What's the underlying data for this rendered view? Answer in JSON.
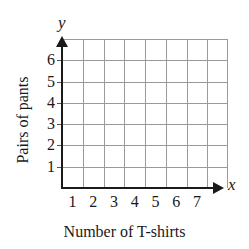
{
  "chart_data": {
    "type": "scatter",
    "title": "",
    "xlabel": "Number of T-shirts",
    "ylabel": "Pairs of pants",
    "x_axis_variable": "x",
    "y_axis_variable": "y",
    "xticks": [
      1,
      2,
      3,
      4,
      5,
      6,
      7
    ],
    "yticks": [
      1,
      2,
      3,
      4,
      5,
      6
    ],
    "xtick_labels": [
      "1",
      "2",
      "3",
      "4",
      "5",
      "6",
      "7"
    ],
    "ytick_labels": [
      "1",
      "2",
      "3",
      "4",
      "5",
      "6"
    ],
    "xlim": [
      0,
      8
    ],
    "ylim": [
      0,
      7
    ],
    "grid": true,
    "grid_columns": 8,
    "grid_rows": 7,
    "legend": null,
    "series": [],
    "values": [],
    "annotations": [],
    "colors": {
      "background": "#ffffff",
      "axis": "#1a1a1a",
      "gridline": "#9a9a9a",
      "text": "#1a1a1a"
    }
  }
}
